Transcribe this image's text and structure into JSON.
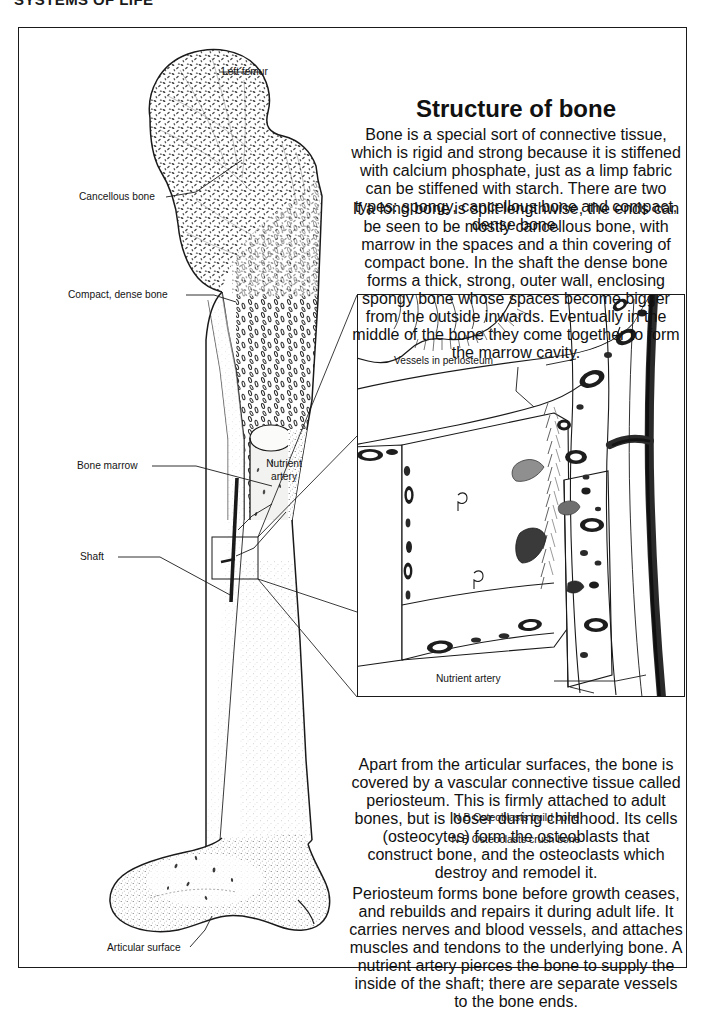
{
  "running_head": "SYSTEMS OF LIFE",
  "column": {
    "heading": "Structure of bone",
    "para1": "Bone is a special sort of connective tissue, which is rigid and strong because it is stiffened with calcium phosphate, just as a limp fabric can be stiffened with starch. There are two types: spongy, cancellous bone and compact, dense bone.",
    "para2": "If a long bone is split lengthwise, the ends can be seen to be mostly cancellous bone, with marrow in the spaces and a thin covering of compact bone. In the shaft the dense bone forms a thick, strong, outer wall, enclosing spongy bone whose spaces become bigger from the outside inwards. Eventually in the middle of the bone they come together to form the marrow cavity.",
    "para3": "Apart from the articular surfaces, the bone is covered by a vascular connective tissue called periosteum. This is firmly attached to adult bones, but is looser during childhood. Its cells (osteocytes) form the osteoblasts that construct bone, and the osteoclasts which destroy and remodel it.",
    "nb1": "N B  Osteoblasts build bone",
    "nb2": "N B  Osteoclasts crush bone",
    "para4": "Periosteum forms bone before growth ceases, and rebuilds and repairs it during adult life. It carries nerves and blood vessels, and attaches muscles and tendons to the underlying bone. A nutrient artery pierces the bone to supply the inside of the shaft; there are separate vessels to the bone ends."
  },
  "femur_labels": {
    "left_femur": "Left femur",
    "cancellous_bone": "Cancellous bone",
    "compact_dense_bone": "Compact, dense bone",
    "bone_marrow": "Bone marrow",
    "shaft": "Shaft",
    "nutrient_artery_line1": "Nutrient",
    "nutrient_artery_line2": "artery",
    "articular_surface": "Articular surface"
  },
  "inset_labels": {
    "vessels_in_periosteum": "Vessels in periosteum",
    "nutrient_artery": "Nutrient artery"
  },
  "colors": {
    "ink": "#1a1a1a",
    "paper": "#ffffff",
    "bone_fill": "#fbfbfa",
    "marrow_fill": "#f2f2f0",
    "vessel_grey": "#8f8f8f",
    "vessel_dark": "#3a3a3a",
    "artery_dark": "#2a2a2a"
  }
}
